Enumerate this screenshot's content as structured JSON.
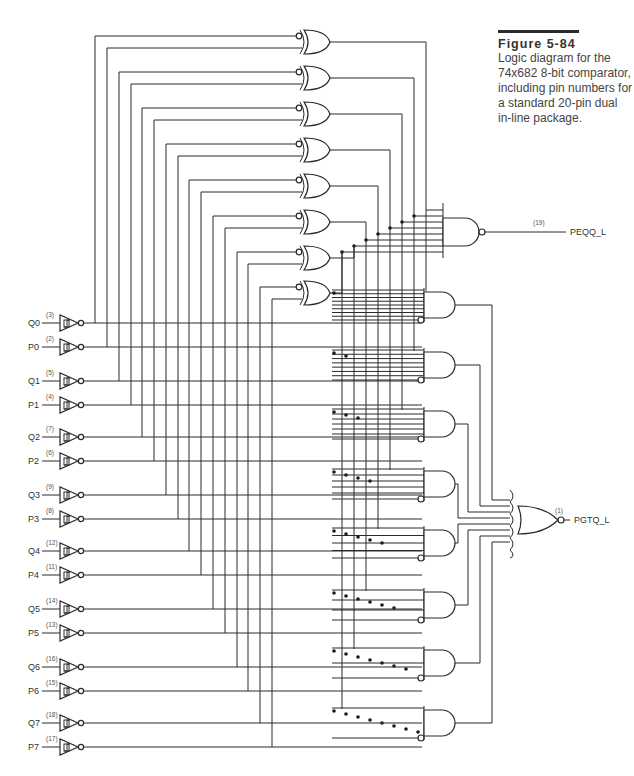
{
  "figure": {
    "title": "Figure 5-84",
    "caption": "Logic diagram for the 74x682 8-bit comparator, including pin numbers for a standard 20-pin dual in-line package.",
    "caption_lines": [
      "Logic diagram for the",
      "74x682 8-bit comparator,",
      "including pin numbers for",
      "a standard 20-pin dual",
      "in-line package."
    ]
  },
  "inputs": [
    {
      "name": "Q0",
      "pin": "(3)"
    },
    {
      "name": "P0",
      "pin": "(2)"
    },
    {
      "name": "Q1",
      "pin": "(5)"
    },
    {
      "name": "P1",
      "pin": "(4)"
    },
    {
      "name": "Q2",
      "pin": "(7)"
    },
    {
      "name": "P2",
      "pin": "(6)"
    },
    {
      "name": "Q3",
      "pin": "(9)"
    },
    {
      "name": "P3",
      "pin": "(8)"
    },
    {
      "name": "Q4",
      "pin": "(12)"
    },
    {
      "name": "P4",
      "pin": "(11)"
    },
    {
      "name": "Q5",
      "pin": "(14)"
    },
    {
      "name": "P5",
      "pin": "(13)"
    },
    {
      "name": "Q6",
      "pin": "(16)"
    },
    {
      "name": "P6",
      "pin": "(15)"
    },
    {
      "name": "Q7",
      "pin": "(18)"
    },
    {
      "name": "P7",
      "pin": "(17)"
    }
  ],
  "outputs": [
    {
      "name": "PEQQ_L",
      "pin": "(19)"
    },
    {
      "name": "PGTQ_L",
      "pin": "(1)"
    }
  ],
  "gates": {
    "input_buffers": 16,
    "xnor_gates": 8,
    "and_gates": 8,
    "output_nand": 1,
    "output_nor": 1
  }
}
